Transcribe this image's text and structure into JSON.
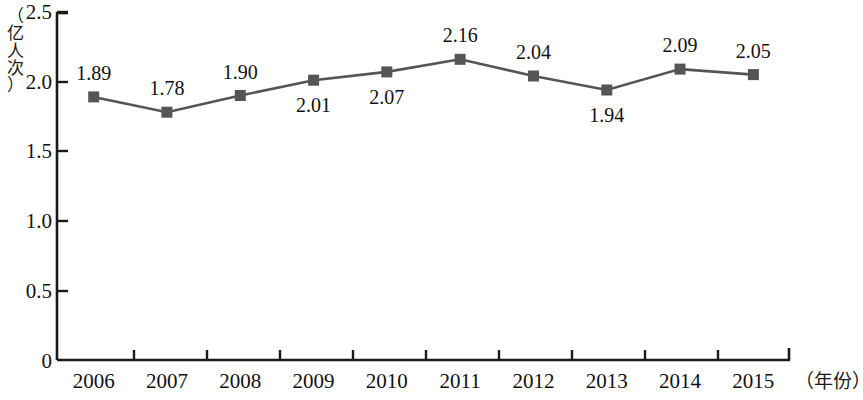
{
  "chart_data": {
    "type": "line",
    "title": "",
    "xlabel": "（年份）",
    "ylabel": "（亿人次）",
    "categories": [
      "2006",
      "2007",
      "2008",
      "2009",
      "2010",
      "2011",
      "2012",
      "2013",
      "2014",
      "2015"
    ],
    "values": [
      1.89,
      1.78,
      1.9,
      2.01,
      2.07,
      2.16,
      2.04,
      1.94,
      2.09,
      2.05
    ],
    "point_labels": [
      "1.89",
      "1.78",
      "1.90",
      "2.01",
      "2.07",
      "2.16",
      "2.04",
      "1.94",
      "2.09",
      "2.05"
    ],
    "label_positions": [
      "above",
      "above",
      "above",
      "below",
      "below",
      "above",
      "above",
      "below",
      "above",
      "above"
    ],
    "ylim": [
      0,
      2.5
    ],
    "y_ticks": [
      0,
      0.5,
      1.0,
      1.5,
      2.0,
      2.5
    ],
    "y_tick_labels": [
      "0",
      "0.5",
      "1.0",
      "1.5",
      "2.0",
      "2.5"
    ],
    "grid": false,
    "legend": "none",
    "marker": "square",
    "series_color": "#555555",
    "line_color": "#555555",
    "axis_color": "#1a1a1a"
  },
  "axes": {
    "y_unit_label": "（亿人次）",
    "y_unit_label_chars": "（\n亿\n人\n次\n）",
    "x_unit_label": "（年份）"
  }
}
